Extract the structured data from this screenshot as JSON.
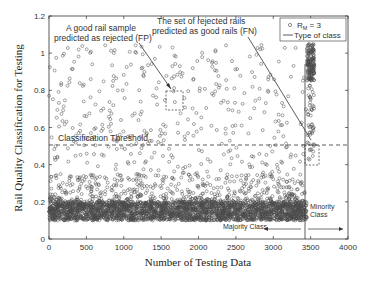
{
  "chart_data": {
    "type": "scatter",
    "title": "",
    "xlabel": "Number of Testing Data",
    "ylabel": "Rail Quality Classification for Testing",
    "xlim": [
      0,
      4000
    ],
    "ylim": [
      0,
      1.2
    ],
    "xticks": [
      0,
      500,
      1000,
      1500,
      2000,
      2500,
      3000,
      3500,
      4000
    ],
    "xtick_labels": [
      "0",
      "500",
      "1000",
      "1500",
      "2000",
      "2500",
      "3000",
      "3500",
      "4000"
    ],
    "yticks": [
      0,
      0.2,
      0.4,
      0.6,
      0.8,
      1,
      1.2
    ],
    "ytick_labels": [
      "0",
      "0.2",
      "0.4",
      "0.6",
      "0.8",
      "1",
      "1.2"
    ],
    "grid": false,
    "legend_position": "upper right",
    "legend": [
      {
        "label": "R_M = 3",
        "marker": "circle"
      },
      {
        "label": "Type of class",
        "marker": "line"
      }
    ],
    "series": [
      {
        "name": "R_M = 3",
        "description": "Majority class (good rails), indices 0-3450: dense band 0.1-0.2, sparser scatter 0.2-0.35, sparse outliers up to ~1.05",
        "x_range": [
          0,
          3450
        ],
        "dense_band": [
          0.1,
          0.2
        ],
        "mid_band": [
          0.2,
          0.35
        ],
        "sparse_range": [
          0.35,
          1.05
        ]
      },
      {
        "name": "R_M = 3 (minority)",
        "description": "Minority class (rejected rails), indices ~3450-3550: dense cluster 0.85-1.05, scattered down to ~0.42",
        "x_range": [
          3450,
          3550
        ],
        "dense_band": [
          0.85,
          1.05
        ],
        "sparse_range": [
          0.42,
          0.85
        ]
      }
    ],
    "threshold": {
      "y": 0.5,
      "label": "Classification Threshold",
      "style": "dashed"
    },
    "class_boundary": {
      "x": 3450,
      "y_top": 0.94,
      "label": "Type of class"
    },
    "annotations": [
      {
        "text_lines": [
          "A good rail sample",
          "predicted as rejected (FP)"
        ],
        "x": 1000,
        "y": 1.1,
        "arrow_from": [
          1300,
          1.05
        ],
        "arrow_to": [
          1650,
          0.8
        ],
        "box": {
          "x0": 1550,
          "x1": 1750,
          "y0": 0.7,
          "y1": 0.82
        }
      },
      {
        "text_lines": [
          "The set of rejected rails",
          "predicted as good rails (FN)"
        ],
        "x": 2300,
        "y": 1.1,
        "line_from": [
          2650,
          1.08
        ],
        "line_to": [
          3500,
          0.53
        ],
        "box": {
          "x0": 3450,
          "x1": 3610,
          "y0": 0.4,
          "y1": 0.5
        }
      },
      {
        "text_lines": [
          "Majority Class"
        ],
        "x": 2950,
        "y": 0.055,
        "arrow": "left"
      },
      {
        "text_lines": [
          "Minority",
          "Class"
        ],
        "x": 3580,
        "y": 0.17
      },
      {
        "text_lines": [
          ""
        ],
        "arrow_from": [
          3520,
          0.055
        ],
        "arrow_to": [
          3940,
          0.055
        ],
        "arrow": "right"
      }
    ]
  },
  "labels": {
    "xlabel": "Number of Testing Data",
    "ylabel": "Rail Quality Classification for Testing",
    "threshold": "Classification Threshold",
    "fp_line1": "A good rail sample",
    "fp_line2": "predicted as rejected (FP)",
    "fn_line1": "The set of rejected rails",
    "fn_line2": "predicted as good rails (FN)",
    "majority": "Majority Class",
    "minority_line1": "Minority",
    "minority_line2": "Class",
    "legend_rm": "R",
    "legend_rm_sub": "M",
    "legend_rm_val": " = 3",
    "legend_type": "Type of class"
  },
  "style": {
    "axis_color": "#333333",
    "marker_color": "#4a4a4a",
    "text_color": "#333333"
  }
}
